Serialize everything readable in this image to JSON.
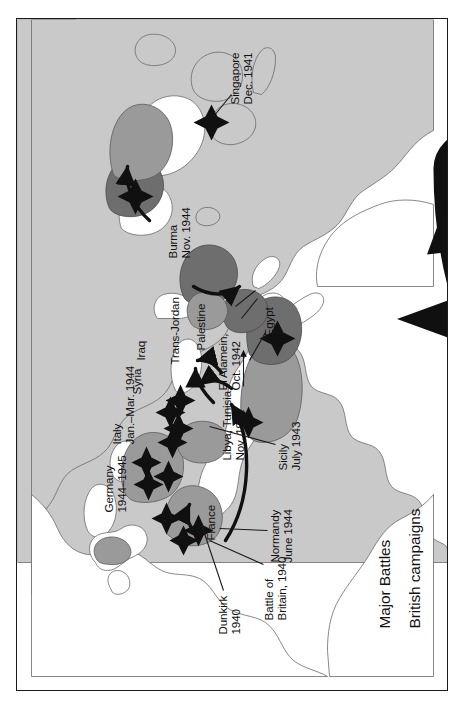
{
  "map": {
    "title": "Major Battles and British campaigns of the Second World War",
    "orientation": "landscape map rotated 90 degrees counter-clockwise",
    "colors": {
      "ocean": "#ffffff",
      "land": "#c9c9c9",
      "land_light": "#d6d6d6",
      "territory_mid": "#9a9a9a",
      "territory_dark": "#6e6e6e",
      "battle_marker": "#101010",
      "coastline": "#6a6a6a",
      "frame": "#1a1a1a",
      "text": "#111111"
    },
    "legend": {
      "items": [
        {
          "symbol": "four-point-star",
          "label": "Major Battles"
        },
        {
          "symbol": "curved-arrow-arc",
          "label": "British campaigns"
        }
      ]
    },
    "battle_labels": [
      {
        "id": "dunkirk",
        "line1": "Dunkirk",
        "line2": "1940",
        "leader": true
      },
      {
        "id": "britain",
        "line1": "Battle of",
        "line2": "Britain, 1940",
        "leader": true
      },
      {
        "id": "normandy",
        "line1": "Normandy",
        "line2": "June 1944",
        "leader": true
      },
      {
        "id": "germany",
        "line1": "Germany",
        "line2": "1944–1945",
        "leader": false
      },
      {
        "id": "italy",
        "line1": "Italy",
        "line2": "Jan.–Mar. 1944",
        "leader": false
      },
      {
        "id": "sicily",
        "line1": "Sicily",
        "line2": "July 1943",
        "leader": true
      },
      {
        "id": "libya-tunisia",
        "line1": "Libya, Tunisia",
        "line2": "Nov. 1942",
        "leader": true
      },
      {
        "id": "el-alamein",
        "line1": "El Alamein,",
        "line2": "Oct. 1942",
        "leader": true
      },
      {
        "id": "burma",
        "line1": "Burma",
        "line2": "Nov. 1944",
        "leader": false
      },
      {
        "id": "singapore",
        "line1": "Singapore",
        "line2": "Dec. 1941",
        "leader": true
      }
    ],
    "territory_labels": [
      {
        "id": "france",
        "text": "France"
      },
      {
        "id": "syria",
        "text": "Syria"
      },
      {
        "id": "iraq",
        "text": "Iraq"
      },
      {
        "id": "trans-jordan",
        "text": "Trans-Jordan"
      },
      {
        "id": "palestine",
        "text": "Palestine"
      },
      {
        "id": "egypt",
        "text": "Egypt"
      }
    ]
  }
}
